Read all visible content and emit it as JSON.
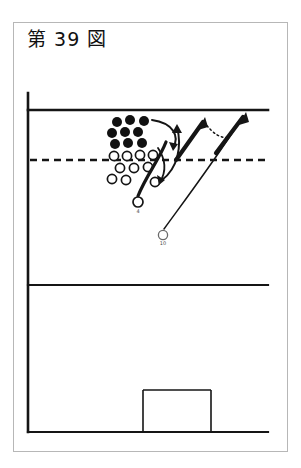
{
  "figure": {
    "title": "第 39 図",
    "caption_number": "39",
    "type": "tactical-play-diagram",
    "sport": "soccer-corner-kick-setup"
  },
  "colors": {
    "ink": "#151515",
    "frame": "#b7b7b7",
    "paper": "#ffffff",
    "marker_fill_dark": "#111111",
    "marker_fill_light": "#ffffff",
    "annotation": "#4a4a4a"
  },
  "court": {
    "name": "half-pitch",
    "left_touchline": {
      "x": 28,
      "y1": 93,
      "y2": 432
    },
    "goal_line": {
      "x1": 28,
      "y1": 110,
      "x2": 268,
      "y2": 110
    },
    "halfway_line": {
      "x1": 28,
      "y1": 285,
      "x2": 268,
      "y2": 285
    },
    "bottom_line": {
      "x1": 28,
      "y1": 432,
      "x2": 268,
      "y2": 432
    },
    "dashed_line": {
      "x1": 30,
      "y": 160,
      "x2": 266,
      "dash": "6 5"
    },
    "goal_box": {
      "x": 143,
      "y": 390,
      "width": 68,
      "height": 42
    }
  },
  "markers": {
    "dark_label": "attacking-player",
    "light_label": "defending-player",
    "dark_players": [
      {
        "id": "d1",
        "cx": 117,
        "cy": 122,
        "r": 5
      },
      {
        "id": "d2",
        "cx": 130,
        "cy": 120,
        "r": 5
      },
      {
        "id": "d3",
        "cx": 144,
        "cy": 121,
        "r": 5
      },
      {
        "id": "d4",
        "cx": 112,
        "cy": 133,
        "r": 5
      },
      {
        "id": "d5",
        "cx": 125,
        "cy": 132,
        "r": 5
      },
      {
        "id": "d6",
        "cx": 138,
        "cy": 132,
        "r": 5
      },
      {
        "id": "d7",
        "cx": 115,
        "cy": 144,
        "r": 5
      },
      {
        "id": "d8",
        "cx": 128,
        "cy": 143,
        "r": 5
      },
      {
        "id": "d9",
        "cx": 142,
        "cy": 143,
        "r": 5
      }
    ],
    "light_players": [
      {
        "id": "l1",
        "cx": 114,
        "cy": 156,
        "r": 5
      },
      {
        "id": "l2",
        "cx": 127,
        "cy": 156,
        "r": 5
      },
      {
        "id": "l3",
        "cx": 140,
        "cy": 155,
        "r": 5
      },
      {
        "id": "l4",
        "cx": 153,
        "cy": 155,
        "r": 5
      },
      {
        "id": "l5",
        "cx": 120,
        "cy": 168,
        "r": 5
      },
      {
        "id": "l6",
        "cx": 134,
        "cy": 168,
        "r": 5
      },
      {
        "id": "l7",
        "cx": 148,
        "cy": 167,
        "r": 5
      },
      {
        "id": "l8",
        "cx": 112,
        "cy": 179,
        "r": 5
      },
      {
        "id": "l9",
        "cx": 126,
        "cy": 180,
        "r": 5
      },
      {
        "id": "l10",
        "cx": 155,
        "cy": 182,
        "r": 5
      }
    ],
    "labelled_runners": [
      {
        "id": "r1",
        "cx": 138,
        "cy": 202,
        "r": 5,
        "label": "4"
      },
      {
        "id": "r2",
        "cx": 163,
        "cy": 235,
        "r": 5,
        "label": "10"
      }
    ]
  },
  "movement": {
    "run_paths": [
      {
        "id": "run-1",
        "from": "r1",
        "d": "M 138 196 C 146 176 160 158 166 142"
      },
      {
        "id": "run-2",
        "from": "r2",
        "d": "M 164 229 C 188 196 215 160 238 124"
      }
    ],
    "thick_arrows": [
      {
        "id": "arrow-1",
        "d": "M 177 158 L 205 118",
        "head": [
          205,
          118
        ]
      },
      {
        "id": "arrow-2",
        "d": "M 215 152 L 245 113",
        "head": [
          245,
          113
        ]
      }
    ],
    "curved_arrows": [
      {
        "id": "curve-1",
        "d": "M 152 121 C 172 124 178 136 172 147",
        "head": [
          172,
          147
        ]
      },
      {
        "id": "curve-2",
        "d": "M 160 178 C 176 166 180 146 176 128",
        "head": [
          176,
          128
        ]
      }
    ],
    "dotted_pass": {
      "id": "pass-1",
      "d": "M 203 121 C 212 133 220 138 228 136",
      "dash": "1.6 3"
    }
  }
}
